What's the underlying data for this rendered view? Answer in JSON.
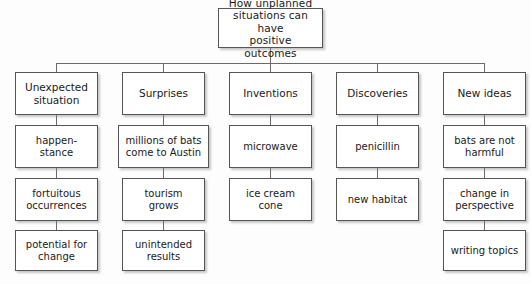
{
  "diagram": {
    "type": "tree-chart",
    "title_node": {
      "label": "How unplanned\nsituations can have\npositive outcomes"
    },
    "branches": [
      {
        "head": "Unexpected\nsituation",
        "items": [
          "happen-\nstance",
          "fortuitous\noccurrences",
          "potential for\nchange"
        ]
      },
      {
        "head": "Surprises",
        "items": [
          "millions of bats\ncome to Austin",
          "tourism\ngrows",
          "unintended\nresults"
        ]
      },
      {
        "head": "Inventions",
        "items": [
          "microwave",
          "ice cream\ncone"
        ]
      },
      {
        "head": "Discoveries",
        "items": [
          "penicillin",
          "new habitat"
        ]
      },
      {
        "head": "New ideas",
        "items": [
          "bats are not\nharmful",
          "change in\nperspective",
          "writing topics"
        ]
      }
    ],
    "colors": {
      "background": "#fdfdfd",
      "box_fill": "#ffffff",
      "box_border": "#555555",
      "connector": "#6a6a6a",
      "text": "#1a1a1a"
    }
  }
}
